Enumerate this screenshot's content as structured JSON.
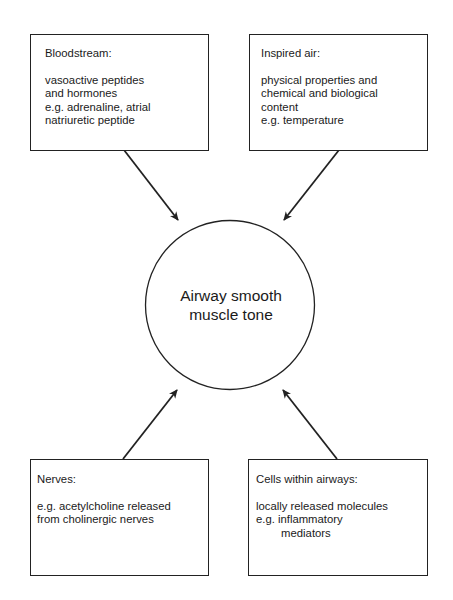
{
  "center": {
    "label_line1": "Airway smooth",
    "label_line2": "muscle tone"
  },
  "boxes": {
    "bloodstream": {
      "title": "Bloodstream:",
      "lines": [
        "vasoactive peptides",
        "and hormones",
        "e.g. adrenaline, atrial",
        "natriuretic peptide"
      ]
    },
    "inspired_air": {
      "title": "Inspired air:",
      "lines": [
        "physical properties and",
        "chemical and biological",
        "content",
        "e.g. temperature"
      ]
    },
    "nerves": {
      "title": "Nerves:",
      "lines": [
        "e.g. acetylcholine released",
        "from cholinergic nerves"
      ]
    },
    "cells": {
      "title": "Cells within airways:",
      "lines": [
        "locally released molecules",
        "e.g. inflammatory",
        "        mediators"
      ]
    }
  },
  "colors": {
    "stroke": "#222222",
    "background": "#ffffff"
  }
}
